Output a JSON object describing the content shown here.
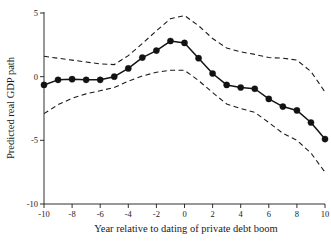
{
  "chart_data": {
    "type": "line",
    "title": "",
    "subtitle": "",
    "xlabel": "Year relative to dating of  private debt boom",
    "ylabel": "Predicted real GDP path",
    "xlim": [
      -10,
      10
    ],
    "ylim": [
      -10.5,
      5.6
    ],
    "grid": false,
    "legend": false,
    "legend_position": "none",
    "xticks": [
      -10,
      -8,
      -6,
      -4,
      -2,
      0,
      2,
      4,
      6,
      8,
      10
    ],
    "xtick_labels": [
      "-10",
      "-8",
      "-6",
      "-4",
      "-2",
      "0",
      "2",
      "4",
      "6",
      "8",
      "10"
    ],
    "yticks": [
      5,
      0,
      -5,
      -10
    ],
    "ytick_labels": [
      "5",
      "0",
      "-5",
      "-10"
    ],
    "x": [
      -10,
      -9,
      -8,
      -7,
      -6,
      -5,
      -4,
      -3,
      -2,
      -1,
      0,
      1,
      2,
      3,
      4,
      5,
      6,
      7,
      8,
      9,
      10
    ],
    "series": [
      {
        "name": "Predicted real GDP path",
        "style": "solid-with-markers",
        "marker": "filled-circle",
        "color": "#121212",
        "values": [
          -0.65,
          -0.25,
          -0.2,
          -0.25,
          -0.25,
          0.0,
          0.65,
          1.5,
          2.05,
          2.8,
          2.65,
          1.45,
          0.25,
          -0.65,
          -0.85,
          -0.95,
          -1.75,
          -2.35,
          -2.65,
          -3.6,
          -4.9
        ]
      },
      {
        "name": "Upper confidence band",
        "style": "dashed",
        "marker": "none",
        "color": "#1a1a1a",
        "values": [
          1.6,
          1.45,
          1.3,
          1.15,
          1.0,
          0.95,
          1.65,
          2.6,
          3.6,
          4.55,
          4.8,
          4.0,
          3.0,
          2.25,
          1.95,
          1.75,
          1.5,
          1.45,
          1.3,
          0.4,
          -1.2
        ]
      },
      {
        "name": "Lower confidence band",
        "style": "dashed",
        "marker": "none",
        "color": "#1a1a1a",
        "values": [
          -2.9,
          -2.2,
          -1.7,
          -1.35,
          -1.1,
          -0.85,
          -0.35,
          0.05,
          0.35,
          0.5,
          0.5,
          -0.3,
          -1.25,
          -2.15,
          -2.5,
          -2.8,
          -3.6,
          -4.45,
          -5.0,
          -6.0,
          -7.5
        ]
      }
    ]
  },
  "axes": {
    "y_title": "Predicted real GDP path",
    "x_title": "Year relative to dating of  private debt boom"
  }
}
